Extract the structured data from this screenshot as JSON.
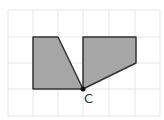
{
  "diagram": {
    "type": "grid-geometry",
    "grid": {
      "cols": 6,
      "rows": 4,
      "origin": [
        8,
        10
      ],
      "cell": 25.4,
      "line_color": "#e6e6e6"
    },
    "shapes": [
      {
        "name": "left-quadrilateral",
        "points": [
          [
            33,
            37
          ],
          [
            58,
            37
          ],
          [
            83,
            89
          ],
          [
            33,
            89
          ]
        ],
        "fill": "#a6a6a6",
        "stroke": "#333333"
      },
      {
        "name": "right-quadrilateral",
        "points": [
          [
            83,
            37
          ],
          [
            136,
            37
          ],
          [
            136,
            63
          ],
          [
            83,
            89
          ]
        ],
        "fill": "#a6a6a6",
        "stroke": "#333333"
      }
    ],
    "point": {
      "label": "C",
      "x": 83,
      "y": 89,
      "color": "#111111"
    }
  }
}
